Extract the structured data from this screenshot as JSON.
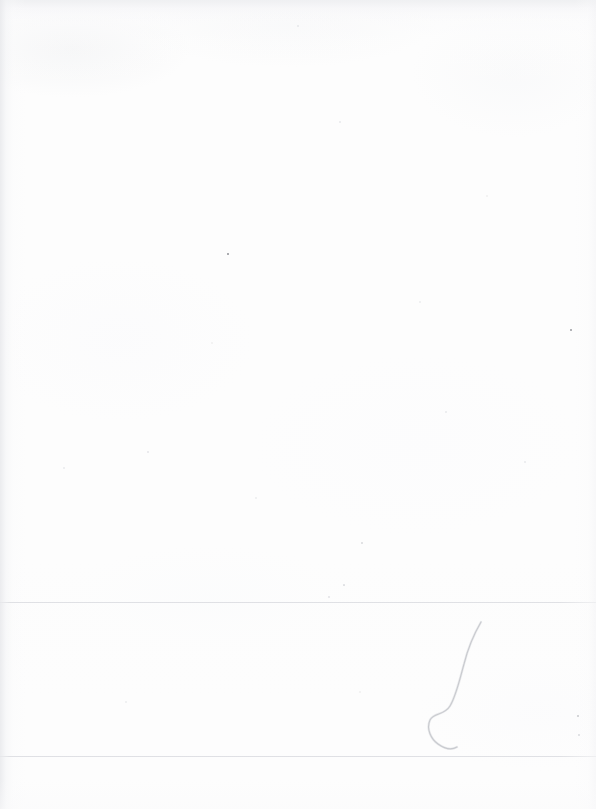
{
  "document": {
    "kind": "scanned-page",
    "title": "Scanned blank page",
    "page_width": 596,
    "page_height": 809,
    "content_text": "",
    "visible_text_present": false,
    "description": "A near-blank scanned sheet of paper. No printed text, headings, figures or tables are visible. Only scanner artifacts appear: faint edge shadows, two very light horizontal ruled lines near the bottom, a curved hair/thread lying on the scanner glass in the lower-right region, and a few tiny dust specks."
  },
  "colors": {
    "paper": "#fdfdfd",
    "page_background": "#ffffff",
    "rule_line": "#e2e3e6",
    "edge_shadow": "#e8e9ec",
    "hair": "#b9bac0",
    "speck_dark": "#6b6d74",
    "speck_light": "#d8d9dd"
  },
  "artifacts": {
    "rule_lines": [
      {
        "name": "upper-rule-line",
        "y": 602,
        "color": "#e2e3e6"
      },
      {
        "name": "lower-rule-line",
        "y": 756,
        "color": "#e4e5e8"
      }
    ],
    "hair": {
      "name": "hair-strand",
      "color": "#b9bac0",
      "bounds": {
        "x": 424,
        "y": 620,
        "width": 62,
        "height": 132
      },
      "path": "M481,622 C474,634 468,648 464,664 C459,682 456,696 450,706 C444,716 434,712 430,720 C426,729 431,739 438,744 C445,749 452,750 457,747"
    },
    "edge_shadows": [
      {
        "name": "left-edge-shadow",
        "edge": "left",
        "extent": 26
      },
      {
        "name": "top-edge-shadow",
        "edge": "top",
        "extent": 22
      },
      {
        "name": "right-edge-shadow",
        "edge": "right",
        "extent": 22
      },
      {
        "name": "bottom-edge-shadow",
        "edge": "bottom",
        "extent": 30
      }
    ],
    "specks": [
      {
        "name": "dust-speck",
        "x": 228,
        "y": 254,
        "size": 2.4,
        "color": "#6b6d74",
        "opacity": 0.75
      },
      {
        "name": "dust-speck",
        "x": 571,
        "y": 330,
        "size": 2.2,
        "color": "#70727a",
        "opacity": 0.7
      },
      {
        "name": "dust-speck",
        "x": 578,
        "y": 716,
        "size": 2.0,
        "color": "#8a8c93",
        "opacity": 0.45
      },
      {
        "name": "dust-speck",
        "x": 579,
        "y": 735,
        "size": 2.6,
        "color": "#b0b2b8",
        "opacity": 0.45
      },
      {
        "name": "dust-speck",
        "x": 362,
        "y": 543,
        "size": 1.8,
        "color": "#b7b9bf",
        "opacity": 0.5
      },
      {
        "name": "dust-speck",
        "x": 344,
        "y": 585,
        "size": 1.7,
        "color": "#c2c4ca",
        "opacity": 0.5
      },
      {
        "name": "dust-speck",
        "x": 329,
        "y": 597,
        "size": 1.6,
        "color": "#c6c8ce",
        "opacity": 0.45
      },
      {
        "name": "dust-speck",
        "x": 148,
        "y": 452,
        "size": 1.6,
        "color": "#cbcdd2",
        "opacity": 0.45
      },
      {
        "name": "dust-speck",
        "x": 446,
        "y": 412,
        "size": 1.5,
        "color": "#cfd1d6",
        "opacity": 0.4
      },
      {
        "name": "dust-speck",
        "x": 525,
        "y": 462,
        "size": 1.5,
        "color": "#d0d2d7",
        "opacity": 0.4
      },
      {
        "name": "dust-speck",
        "x": 340,
        "y": 122,
        "size": 1.5,
        "color": "#cfd1d6",
        "opacity": 0.4
      },
      {
        "name": "dust-speck",
        "x": 737,
        "y": 124,
        "size": 1.4,
        "color": "#d4d6da",
        "opacity": 0.35
      },
      {
        "name": "dust-speck",
        "x": 298,
        "y": 26,
        "size": 1.4,
        "color": "#cdcfd4",
        "opacity": 0.4
      },
      {
        "name": "dust-speck",
        "x": 64,
        "y": 468,
        "size": 1.5,
        "color": "#d2d4d9",
        "opacity": 0.4
      },
      {
        "name": "dust-speck",
        "x": 256,
        "y": 498,
        "size": 1.4,
        "color": "#d4d6da",
        "opacity": 0.35
      },
      {
        "name": "dust-speck",
        "x": 420,
        "y": 302,
        "size": 1.4,
        "color": "#d4d6da",
        "opacity": 0.35
      },
      {
        "name": "dust-speck",
        "x": 126,
        "y": 702,
        "size": 1.5,
        "color": "#d2d4d9",
        "opacity": 0.35
      },
      {
        "name": "dust-speck",
        "x": 360,
        "y": 692,
        "size": 1.4,
        "color": "#d6d8dc",
        "opacity": 0.3
      },
      {
        "name": "dust-speck",
        "x": 487,
        "y": 196,
        "size": 1.4,
        "color": "#d6d8dc",
        "opacity": 0.3
      },
      {
        "name": "dust-speck",
        "x": 212,
        "y": 343,
        "size": 1.4,
        "color": "#d6d8dc",
        "opacity": 0.3
      }
    ]
  }
}
